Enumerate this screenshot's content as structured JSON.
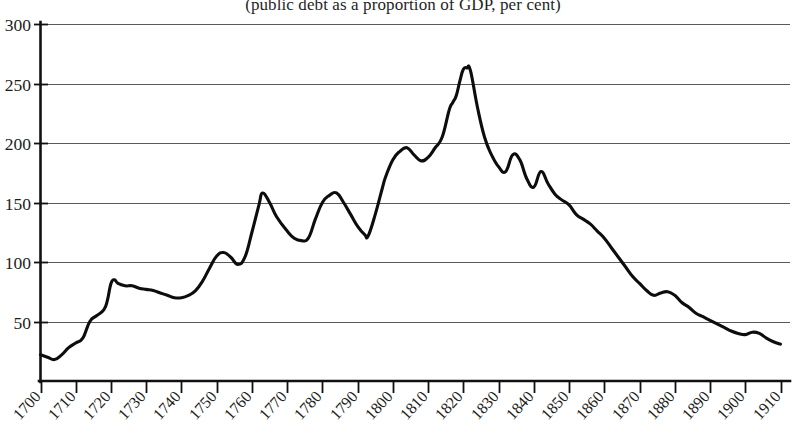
{
  "chart_data": {
    "type": "line",
    "title": "",
    "subtitle": "(public debt as a proportion of GDP, per cent)",
    "xlabel": "",
    "ylabel": "",
    "xlim": [
      1700,
      1910
    ],
    "ylim": [
      0,
      300
    ],
    "grid": true,
    "legend": "none",
    "y_ticks": [
      300,
      250,
      200,
      150,
      100,
      50
    ],
    "x_ticks": [
      1700,
      1710,
      1720,
      1730,
      1740,
      1750,
      1760,
      1770,
      1780,
      1790,
      1800,
      1810,
      1820,
      1830,
      1840,
      1850,
      1860,
      1870,
      1880,
      1890,
      1900,
      1910
    ],
    "series": [
      {
        "name": "public debt / GDP",
        "color": "#0d0d0d",
        "x": [
          1700,
          1702,
          1704,
          1706,
          1708,
          1710,
          1712,
          1714,
          1716,
          1718,
          1719,
          1720,
          1721,
          1722,
          1724,
          1726,
          1728,
          1730,
          1732,
          1734,
          1736,
          1738,
          1740,
          1742,
          1744,
          1746,
          1748,
          1750,
          1752,
          1754,
          1756,
          1758,
          1760,
          1762,
          1763,
          1765,
          1767,
          1770,
          1772,
          1774,
          1776,
          1778,
          1780,
          1782,
          1784,
          1786,
          1788,
          1790,
          1792,
          1793,
          1795,
          1797,
          1798,
          1800,
          1802,
          1804,
          1806,
          1808,
          1810,
          1812,
          1814,
          1816,
          1817,
          1818,
          1819,
          1820,
          1821,
          1822,
          1824,
          1826,
          1828,
          1830,
          1832,
          1834,
          1836,
          1838,
          1840,
          1842,
          1844,
          1846,
          1848,
          1850,
          1852,
          1854,
          1856,
          1858,
          1860,
          1862,
          1864,
          1866,
          1868,
          1870,
          1872,
          1874,
          1876,
          1878,
          1880,
          1882,
          1884,
          1886,
          1888,
          1890,
          1892,
          1894,
          1896,
          1898,
          1900,
          1902,
          1904,
          1906,
          1908,
          1910
        ],
        "y": [
          22,
          20,
          18,
          22,
          28,
          32,
          36,
          50,
          55,
          60,
          68,
          82,
          85,
          82,
          80,
          80,
          78,
          77,
          76,
          74,
          72,
          70,
          70,
          72,
          76,
          84,
          95,
          105,
          108,
          104,
          98,
          104,
          125,
          148,
          158,
          150,
          138,
          126,
          120,
          118,
          120,
          136,
          150,
          156,
          158,
          150,
          140,
          130,
          123,
          122,
          140,
          162,
          172,
          186,
          193,
          196,
          190,
          185,
          188,
          196,
          205,
          228,
          234,
          240,
          252,
          262,
          263,
          261,
          230,
          205,
          190,
          180,
          176,
          190,
          186,
          170,
          163,
          176,
          166,
          157,
          152,
          148,
          140,
          136,
          132,
          126,
          120,
          112,
          104,
          96,
          88,
          82,
          76,
          72,
          74,
          75,
          72,
          66,
          62,
          57,
          54,
          51,
          48,
          45,
          42,
          40,
          39,
          41,
          40,
          36,
          33,
          31
        ]
      }
    ]
  }
}
